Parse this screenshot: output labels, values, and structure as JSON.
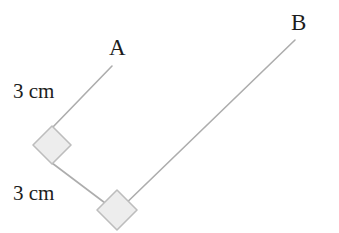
{
  "figure": {
    "background_color": "#ffffff",
    "stroke_color": "#adadad",
    "marker_fill_color": "#ededed",
    "marker_stroke_color": "#bdbdbd",
    "text_color": "#1c1c1c",
    "width": 339,
    "height": 233
  },
  "labels": {
    "vertex_a": "A",
    "vertex_b": "B",
    "length_top": "3 cm",
    "length_bottom": "3 cm"
  },
  "geometry": {
    "segments": [
      {
        "name": "segment-a",
        "x1": 112,
        "y1": 66,
        "x2": 52,
        "y2": 128,
        "label": "3 cm",
        "endpoint_label": "A"
      },
      {
        "name": "segment-middle",
        "x1": 52,
        "y1": 163,
        "x2": 117,
        "y2": 212,
        "label": "3 cm"
      },
      {
        "name": "segment-b",
        "x1": 117,
        "y1": 212,
        "x2": 295,
        "y2": 40,
        "endpoint_label": "B"
      }
    ],
    "right_angle_markers": [
      {
        "name": "right-angle-marker-upper",
        "cx": 52,
        "cy": 145,
        "half": 19
      },
      {
        "name": "right-angle-marker-lower",
        "cx": 117,
        "cy": 210,
        "half": 20
      }
    ]
  }
}
